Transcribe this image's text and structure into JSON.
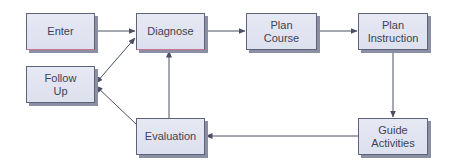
{
  "diagram": {
    "type": "flowchart",
    "colors": {
      "box_fill": "#e2e5f1",
      "box_border": "#5d6378",
      "box_shadow": "#8a8fa3",
      "text": "#3d4254",
      "arrow": "#4a4f62",
      "background": "#ffffff"
    },
    "nodes": [
      {
        "id": "enter",
        "label": "Enter"
      },
      {
        "id": "diagnose",
        "label": "Diagnose"
      },
      {
        "id": "plan_course",
        "label": "Plan\nCourse"
      },
      {
        "id": "plan_instruction",
        "label": "Plan\nInstruction"
      },
      {
        "id": "follow_up",
        "label": "Follow\nUp"
      },
      {
        "id": "evaluation",
        "label": "Evaluation"
      },
      {
        "id": "guide_activities",
        "label": "Guide\nActivities"
      }
    ],
    "edges": [
      {
        "from": "enter",
        "to": "diagnose"
      },
      {
        "from": "diagnose",
        "to": "plan_course"
      },
      {
        "from": "plan_course",
        "to": "plan_instruction"
      },
      {
        "from": "plan_instruction",
        "to": "guide_activities"
      },
      {
        "from": "guide_activities",
        "to": "evaluation"
      },
      {
        "from": "evaluation",
        "to": "diagnose"
      },
      {
        "from": "evaluation",
        "to": "follow_up"
      },
      {
        "from": "follow_up",
        "to": "diagnose",
        "bidirectional": true
      }
    ]
  }
}
